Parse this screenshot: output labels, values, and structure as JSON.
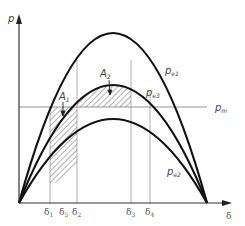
{
  "diagram": {
    "type": "power-angle curve (equal area criterion)",
    "axes": {
      "y_label": "p",
      "x_label": "δ"
    },
    "curves": [
      {
        "id": "pe1",
        "label": "p",
        "sub": "e1",
        "peak_y": 33
      },
      {
        "id": "pe3",
        "label": "p",
        "sub": "e3",
        "peak_y": 85
      },
      {
        "id": "pe2",
        "label": "p",
        "sub": "e2",
        "peak_y": 119
      }
    ],
    "mechanical_power": {
      "label": "p",
      "sub": "m"
    },
    "areas": [
      {
        "label": "A",
        "sub": "1"
      },
      {
        "label": "A",
        "sub": "2"
      }
    ],
    "x_ticks": [
      {
        "label": "δ",
        "sub": "1"
      },
      {
        "label": "δ",
        "sub": "5"
      },
      {
        "label": "δ",
        "sub": "2"
      },
      {
        "label": "δ",
        "sub": "3"
      },
      {
        "label": "δ",
        "sub": "4"
      }
    ],
    "colors": {
      "curve": "#111111",
      "line": "#888888",
      "hatch": "#555555"
    }
  }
}
